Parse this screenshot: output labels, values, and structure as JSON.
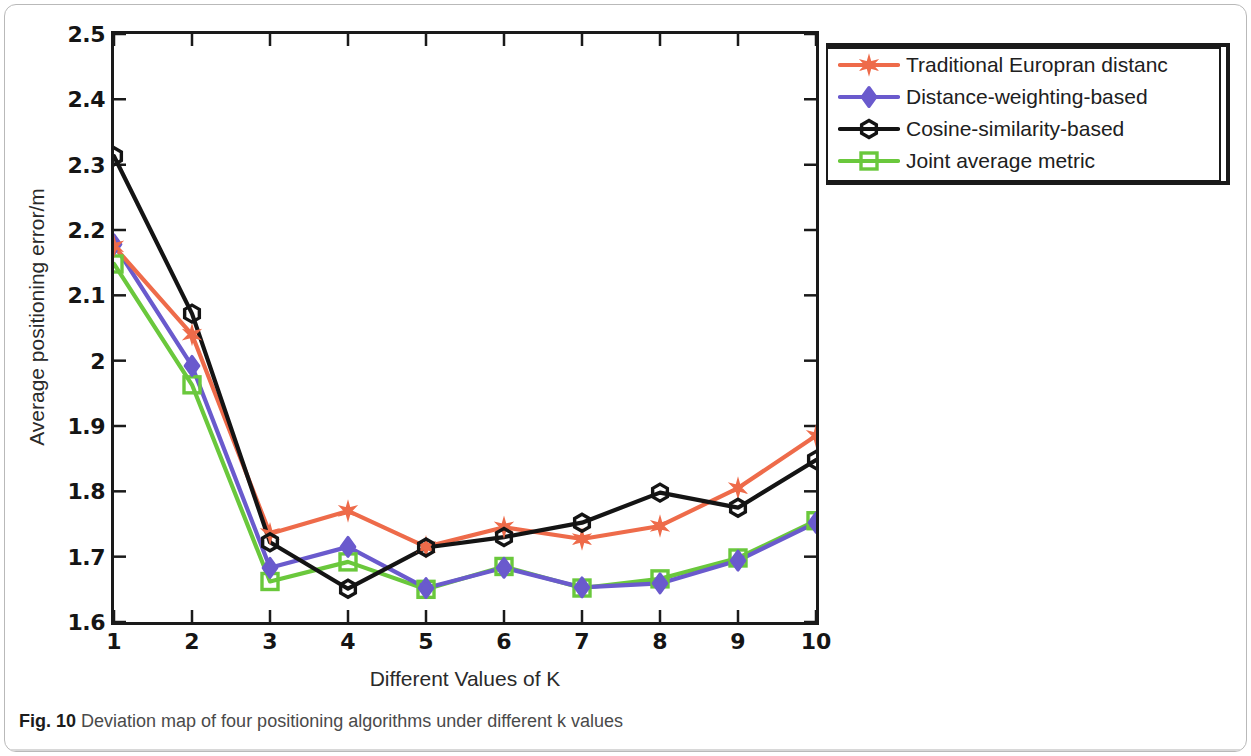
{
  "caption": {
    "figure_number": "Fig. 10",
    "text": "Deviation map of four positioning algorithms under different k values"
  },
  "axes": {
    "xlabel": "Different Values of K",
    "ylabel": "Average positioning error/m",
    "xticks": [
      "1",
      "2",
      "3",
      "4",
      "5",
      "6",
      "7",
      "8",
      "9",
      "10"
    ],
    "yticks": [
      "2.5",
      "2.4",
      "2.3",
      "2.2",
      "2.1",
      "2",
      "1.9",
      "1.8",
      "1.7",
      "1.6"
    ]
  },
  "legend": {
    "items": [
      {
        "label": "Traditional Europran distanc",
        "color": "#ee6b4a",
        "marker": "star"
      },
      {
        "label": "Distance-weighting-based",
        "color": "#6a5acd",
        "marker": "diamond"
      },
      {
        "label": "Cosine-similarity-based",
        "color": "#141414",
        "marker": "hexagon"
      },
      {
        "label": "Joint average metric",
        "color": "#6ac83c",
        "marker": "square"
      }
    ]
  },
  "chart_data": {
    "type": "line",
    "title": "",
    "xlabel": "Different Values of K",
    "ylabel": "Average positioning error/m",
    "x": [
      1,
      2,
      3,
      4,
      5,
      6,
      7,
      8,
      9,
      10
    ],
    "xlim": [
      1,
      10
    ],
    "ylim": [
      1.6,
      2.5
    ],
    "ytick_step": 0.1,
    "grid": false,
    "legend_position": "top-right-outside",
    "series": [
      {
        "name": "Traditional Europran distanc",
        "color": "#ee6b4a",
        "marker": "star",
        "values": [
          2.175,
          2.04,
          1.735,
          1.77,
          1.715,
          1.745,
          1.727,
          1.747,
          1.805,
          1.885
        ]
      },
      {
        "name": "Distance-weighting-based",
        "color": "#6a5acd",
        "marker": "diamond",
        "values": [
          2.178,
          1.992,
          1.683,
          1.715,
          1.652,
          1.683,
          1.653,
          1.659,
          1.694,
          1.752
        ]
      },
      {
        "name": "Cosine-similarity-based",
        "color": "#141414",
        "marker": "hexagon",
        "values": [
          2.313,
          2.072,
          1.722,
          1.651,
          1.714,
          1.73,
          1.752,
          1.798,
          1.775,
          1.848
        ]
      },
      {
        "name": "Joint average metric",
        "color": "#6ac83c",
        "marker": "square",
        "values": [
          2.148,
          1.963,
          1.662,
          1.692,
          1.65,
          1.685,
          1.652,
          1.666,
          1.698,
          1.755
        ]
      }
    ]
  }
}
